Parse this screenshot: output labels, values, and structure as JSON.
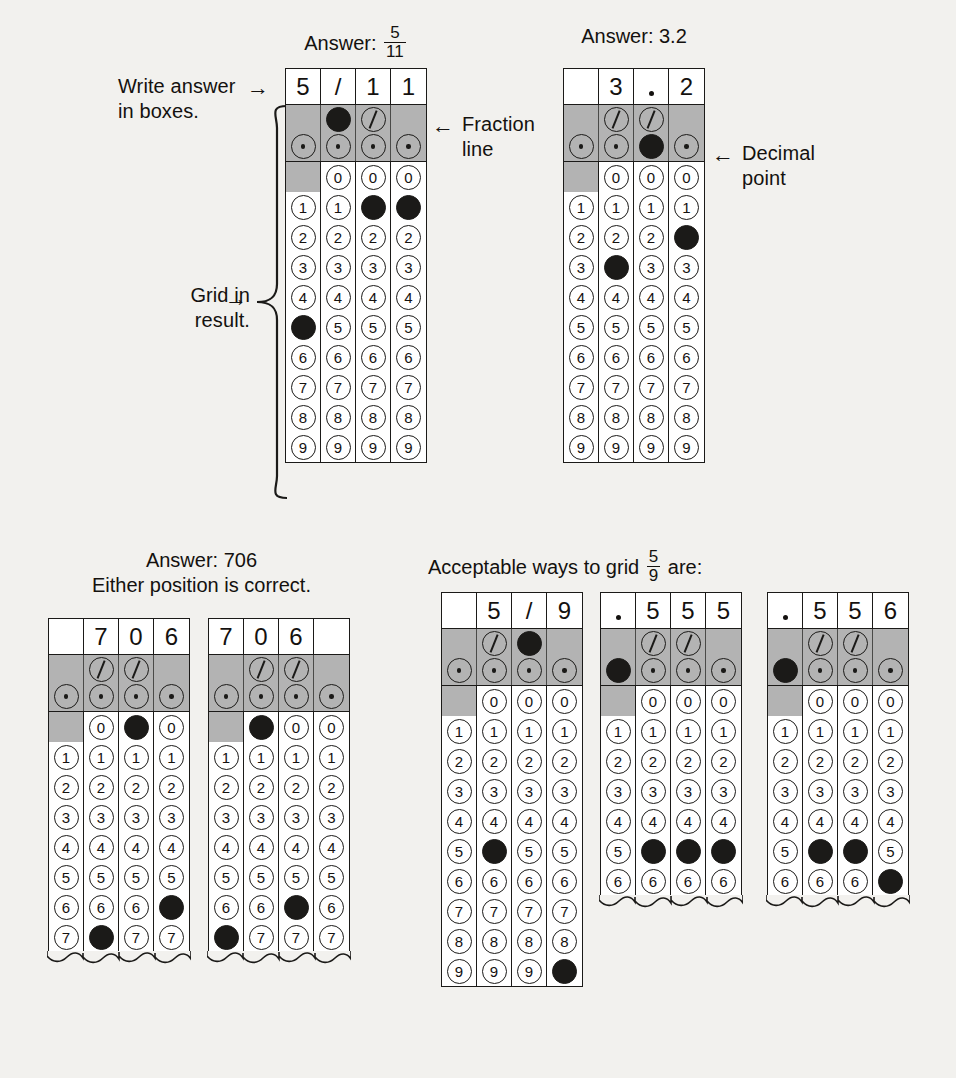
{
  "annotations": {
    "write_answer": "Write answer\nin boxes.",
    "grid_in_result": "Grid in\nresult.",
    "fraction_line": "Fraction\nline",
    "decimal_point": "Decimal\npoint",
    "arrow_right": "→",
    "arrow_left": "←"
  },
  "captions": {
    "answer_prefix": "Answer:",
    "grid1_frac_num": "5",
    "grid1_frac_den": "11",
    "grid2": "Answer: 3.2",
    "grid34_line1": "Answer: 706",
    "grid34_line2": "Either position is correct.",
    "grid567_pre": "Acceptable ways to grid",
    "grid567_num": "5",
    "grid567_den": "9",
    "grid567_post": "are:"
  },
  "colors": {
    "page_background": "#f2f1ee",
    "ink": "#14110f",
    "grid_line": "#1b1a18",
    "shaded_band": "#b3b3b3",
    "cell_background": "#ffffff"
  },
  "bubble_digits": [
    "0",
    "1",
    "2",
    "3",
    "4",
    "5",
    "6",
    "7",
    "8",
    "9"
  ],
  "grids": [
    {
      "id": "grid-fraction-5-11",
      "written": [
        "5",
        "/",
        "1",
        "1"
      ],
      "written_types": [
        "digit",
        "slash",
        "digit",
        "digit"
      ],
      "rows_shown": 10,
      "truncated": false,
      "fraction_bar": [
        null,
        "filled",
        "empty",
        null
      ],
      "decimal_point": [
        "empty",
        "empty",
        "empty",
        "empty"
      ],
      "zero_available": [
        false,
        true,
        true,
        true
      ],
      "marked": [
        5,
        null,
        1,
        1
      ],
      "marked_decimal": [
        false,
        false,
        false,
        false
      ]
    },
    {
      "id": "grid-decimal-3-2",
      "written": [
        "",
        "3",
        ".",
        "2"
      ],
      "written_types": [
        "blank",
        "digit",
        "dot",
        "digit"
      ],
      "rows_shown": 10,
      "truncated": false,
      "fraction_bar": [
        null,
        "empty",
        "empty",
        null
      ],
      "decimal_point": [
        "empty",
        "empty",
        "filled",
        "empty"
      ],
      "zero_available": [
        false,
        true,
        true,
        true
      ],
      "marked": [
        null,
        3,
        null,
        2
      ],
      "marked_decimal": [
        false,
        false,
        true,
        false
      ]
    },
    {
      "id": "grid-706-right",
      "written": [
        "",
        "7",
        "0",
        "6"
      ],
      "written_types": [
        "blank",
        "digit",
        "digit",
        "digit"
      ],
      "rows_shown": 8,
      "truncated": true,
      "fraction_bar": [
        null,
        "empty",
        "empty",
        null
      ],
      "decimal_point": [
        "empty",
        "empty",
        "empty",
        "empty"
      ],
      "zero_available": [
        false,
        true,
        true,
        true
      ],
      "marked": [
        null,
        7,
        0,
        6
      ],
      "marked_decimal": [
        false,
        false,
        false,
        false
      ]
    },
    {
      "id": "grid-706-left",
      "written": [
        "7",
        "0",
        "6",
        ""
      ],
      "written_types": [
        "digit",
        "digit",
        "digit",
        "blank"
      ],
      "rows_shown": 8,
      "truncated": true,
      "fraction_bar": [
        null,
        "empty",
        "empty",
        null
      ],
      "decimal_point": [
        "empty",
        "empty",
        "empty",
        "empty"
      ],
      "zero_available": [
        false,
        true,
        true,
        true
      ],
      "marked": [
        7,
        0,
        6,
        null
      ],
      "marked_decimal": [
        false,
        false,
        false,
        false
      ]
    },
    {
      "id": "grid-fraction-5-9",
      "written": [
        "",
        "5",
        "/",
        "9"
      ],
      "written_types": [
        "blank",
        "digit",
        "slash",
        "digit"
      ],
      "rows_shown": 10,
      "truncated": false,
      "fraction_bar": [
        null,
        "empty",
        "filled",
        null
      ],
      "decimal_point": [
        "empty",
        "empty",
        "empty",
        "empty"
      ],
      "zero_available": [
        false,
        true,
        true,
        true
      ],
      "marked": [
        null,
        5,
        null,
        9
      ],
      "marked_decimal": [
        false,
        false,
        false,
        false
      ]
    },
    {
      "id": "grid-decimal-555",
      "written": [
        ".",
        "5",
        "5",
        "5"
      ],
      "written_types": [
        "dot",
        "digit",
        "digit",
        "digit"
      ],
      "rows_shown": 7,
      "truncated": true,
      "fraction_bar": [
        null,
        "empty",
        "empty",
        null
      ],
      "decimal_point": [
        "filled",
        "empty",
        "empty",
        "empty"
      ],
      "zero_available": [
        false,
        true,
        true,
        true
      ],
      "marked": [
        null,
        5,
        5,
        5
      ],
      "marked_decimal": [
        true,
        false,
        false,
        false
      ]
    },
    {
      "id": "grid-decimal-556",
      "written": [
        ".",
        "5",
        "5",
        "6"
      ],
      "written_types": [
        "dot",
        "digit",
        "digit",
        "digit"
      ],
      "rows_shown": 7,
      "truncated": true,
      "fraction_bar": [
        null,
        "empty",
        "empty",
        null
      ],
      "decimal_point": [
        "filled",
        "empty",
        "empty",
        "empty"
      ],
      "zero_available": [
        false,
        true,
        true,
        true
      ],
      "marked": [
        null,
        5,
        5,
        6
      ],
      "marked_decimal": [
        true,
        false,
        false,
        false
      ]
    }
  ],
  "layout": {
    "grid_positions": [
      {
        "id": "grid-fraction-5-11",
        "left": 285,
        "top": 68
      },
      {
        "id": "grid-decimal-3-2",
        "left": 563,
        "top": 68
      },
      {
        "id": "grid-706-right",
        "left": 48,
        "top": 618
      },
      {
        "id": "grid-706-left",
        "left": 208,
        "top": 618
      },
      {
        "id": "grid-fraction-5-9",
        "left": 441,
        "top": 592
      },
      {
        "id": "grid-decimal-555",
        "left": 600,
        "top": 592
      },
      {
        "id": "grid-decimal-556",
        "left": 767,
        "top": 592
      }
    ]
  }
}
